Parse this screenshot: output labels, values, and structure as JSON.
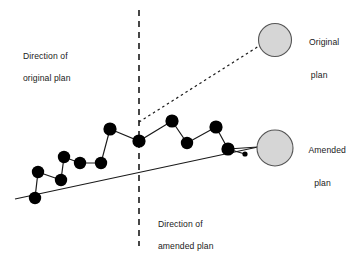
{
  "diagram": {
    "type": "trajectory-deviation-diagram",
    "labels": {
      "direction_original_line1": "Direction of",
      "direction_original_line2": "original plan",
      "direction_amended_line1": "Direction of",
      "direction_amended_line2": "amended plan",
      "original_plan_line1": "Original",
      "original_plan_line2": "plan",
      "amended_plan_line1": "Amended",
      "amended_plan_line2": "plan"
    },
    "colors": {
      "node_fill": "#000000",
      "stroke": "#1a1a1a",
      "circle_fill": "#d6d6d6",
      "circle_stroke": "#555555",
      "background": "#ffffff",
      "text": "#1a1a1a"
    },
    "circles": [
      {
        "name": "original-plan-circle",
        "cx": 275,
        "cy": 40,
        "r": 16.5
      },
      {
        "name": "amended-plan-circle",
        "cx": 275,
        "cy": 148,
        "r": 18
      }
    ],
    "decision_line": {
      "x": 139,
      "y1": 10,
      "y2": 246,
      "dash": "6 5"
    },
    "original_projection": {
      "x1": 139,
      "y1": 122,
      "x2": 259,
      "y2": 46,
      "dash": "2.5 3"
    },
    "trend_line": {
      "x1": 15,
      "y1": 199,
      "x2": 258,
      "y2": 147
    },
    "nodes": [
      {
        "id": "n1",
        "cx": 35,
        "cy": 198,
        "r": 6.2
      },
      {
        "id": "n2",
        "cx": 38,
        "cy": 172,
        "r": 6.2
      },
      {
        "id": "n3",
        "cx": 61,
        "cy": 180,
        "r": 6.2
      },
      {
        "id": "n4",
        "cx": 64,
        "cy": 157,
        "r": 6.2
      },
      {
        "id": "n5",
        "cx": 80,
        "cy": 163,
        "r": 6.2
      },
      {
        "id": "n6",
        "cx": 101,
        "cy": 163,
        "r": 6.2
      },
      {
        "id": "n7",
        "cx": 110,
        "cy": 129,
        "r": 6.6
      },
      {
        "id": "n8",
        "cx": 139,
        "cy": 141,
        "r": 6.6
      },
      {
        "id": "n9",
        "cx": 172,
        "cy": 121,
        "r": 6.6
      },
      {
        "id": "n10",
        "cx": 187,
        "cy": 143,
        "r": 6.2
      },
      {
        "id": "n11",
        "cx": 216,
        "cy": 127,
        "r": 6.6
      },
      {
        "id": "n12",
        "cx": 228,
        "cy": 149,
        "r": 6.6
      },
      {
        "id": "n13",
        "cx": 245,
        "cy": 154,
        "r": 2.6
      }
    ],
    "node_path": "35,198 38,172 61,180 64,157 80,163 101,163 110,129 139,141 172,121 187,143 216,127 228,149 245,154",
    "tail_segment": {
      "x1": 228,
      "y1": 149,
      "x2": 258,
      "y2": 147
    }
  }
}
